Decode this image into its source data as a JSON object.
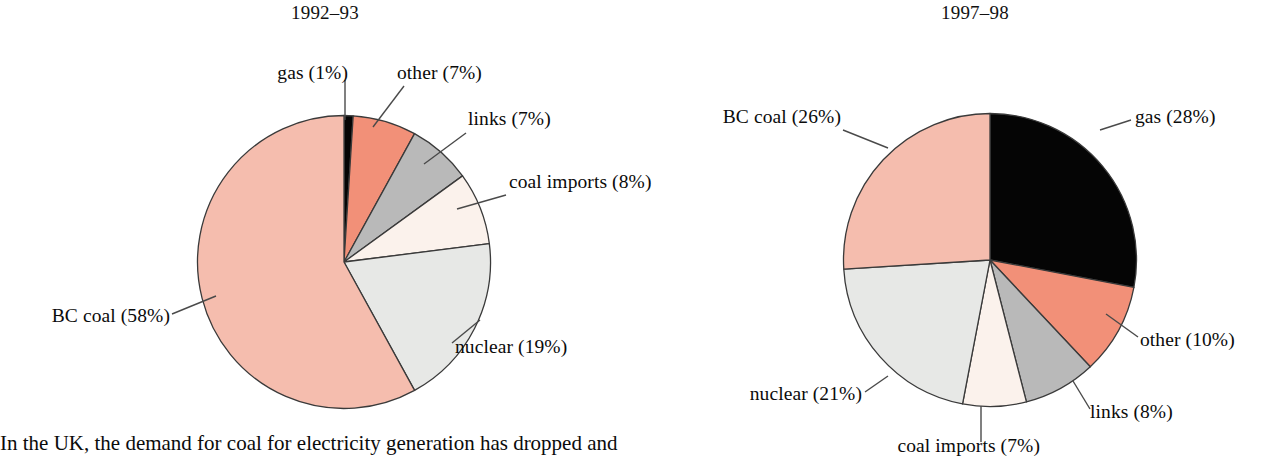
{
  "caption": "In the UK, the demand for coal for electricity generation has dropped and",
  "colors": {
    "gas": "#050505",
    "other": "#f29078",
    "links": "#b9b9b9",
    "coal_imports": "#fbf2ec",
    "nuclear": "#e7e8e6",
    "bc_coal": "#f5bdae",
    "outline": "#3a3a3a",
    "leader": "#4a4a4a"
  },
  "chart_data": [
    {
      "type": "pie",
      "title": "1992–93",
      "categories": [
        "gas",
        "other",
        "links",
        "coal imports",
        "nuclear",
        "BC coal"
      ],
      "values": [
        1,
        7,
        7,
        8,
        19,
        58
      ],
      "labels": [
        "gas (1%)",
        "other (7%)",
        "links (7%)",
        "coal imports (8%)",
        "nuclear (19%)",
        "BC coal (58%)"
      ],
      "legend": "callout-labels-with-leader-lines",
      "start_angle": 0,
      "direction": "clockwise",
      "units": "percent"
    },
    {
      "type": "pie",
      "title": "1997–98",
      "categories": [
        "gas",
        "other",
        "links",
        "coal imports",
        "nuclear",
        "BC coal"
      ],
      "values": [
        28,
        10,
        8,
        7,
        21,
        26
      ],
      "labels": [
        "gas (28%)",
        "other (10%)",
        "links (8%)",
        "coal imports (7%)",
        "nuclear (21%)",
        "BC coal (26%)"
      ],
      "legend": "callout-labels-with-leader-lines",
      "start_angle": 0,
      "direction": "clockwise",
      "units": "percent"
    }
  ],
  "left_chart": {
    "title": "1992–93",
    "labels": {
      "gas": "gas (1%)",
      "other": "other (7%)",
      "links": "links (7%)",
      "coal_imports": "coal imports (8%)",
      "nuclear": "nuclear (19%)",
      "bc_coal": "BC coal (58%)"
    }
  },
  "right_chart": {
    "title": "1997–98",
    "labels": {
      "gas": "gas (28%)",
      "other": "other (10%)",
      "links": "links (8%)",
      "coal_imports": "coal imports (7%)",
      "nuclear": "nuclear (21%)",
      "bc_coal": "BC coal (26%)"
    }
  }
}
